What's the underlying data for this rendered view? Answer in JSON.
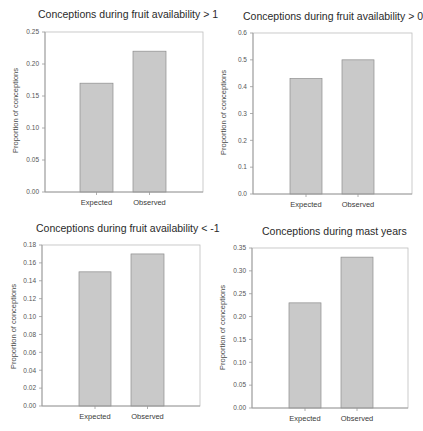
{
  "style": {
    "bar_fill": "#c9c9c9",
    "bar_stroke": "#8c8c8c",
    "axis_color": "#9a9a9a",
    "frame_color": "#bdbdbd"
  },
  "charts": [
    {
      "title": "Conceptions during fruit availability > 1",
      "ylabel": "Proportion of conceptions",
      "ticks": [
        "0.00",
        "0.05",
        "0.10",
        "0.15",
        "0.20",
        "0.25"
      ],
      "categories": [
        "Expected",
        "Observed"
      ]
    },
    {
      "title": "Conceptions during fruit availability > 0",
      "ylabel": "Proportion of conceptions",
      "ticks": [
        "0.0",
        "0.1",
        "0.2",
        "0.3",
        "0.4",
        "0.5",
        "0.6"
      ],
      "categories": [
        "Expected",
        "Observed"
      ]
    },
    {
      "title": "Conceptions during fruit availability < -1",
      "ylabel": "Proportion of conceptions",
      "ticks": [
        "0.00",
        "0.02",
        "0.04",
        "0.06",
        "0.08",
        "0.10",
        "0.12",
        "0.14",
        "0.16",
        "0.18"
      ],
      "categories": [
        "Expected",
        "Observed"
      ]
    },
    {
      "title": "Conceptions during mast years",
      "ylabel": "Proportion of conceptions",
      "ticks": [
        "0.00",
        "0.05",
        "0.10",
        "0.15",
        "0.20",
        "0.25",
        "0.30",
        "0.35"
      ],
      "categories": [
        "Expected",
        "Observed"
      ]
    }
  ],
  "chart_data": [
    {
      "type": "bar",
      "title": "Conceptions during fruit availability > 1",
      "xlabel": "",
      "ylabel": "Proportion of conceptions",
      "categories": [
        "Expected",
        "Observed"
      ],
      "values": [
        0.17,
        0.22
      ],
      "ylim": [
        0,
        0.25
      ],
      "yticks": [
        0.0,
        0.05,
        0.1,
        0.15,
        0.2,
        0.25
      ],
      "grid": false,
      "legend": null
    },
    {
      "type": "bar",
      "title": "Conceptions during fruit availability > 0",
      "xlabel": "",
      "ylabel": "Proportion of conceptions",
      "categories": [
        "Expected",
        "Observed"
      ],
      "values": [
        0.43,
        0.5
      ],
      "ylim": [
        0,
        0.6
      ],
      "yticks": [
        0.0,
        0.1,
        0.2,
        0.3,
        0.4,
        0.5,
        0.6
      ],
      "grid": false,
      "legend": null
    },
    {
      "type": "bar",
      "title": "Conceptions during fruit availability < -1",
      "xlabel": "",
      "ylabel": "Proportion of conceptions",
      "categories": [
        "Expected",
        "Observed"
      ],
      "values": [
        0.15,
        0.17
      ],
      "ylim": [
        0,
        0.18
      ],
      "yticks": [
        0.0,
        0.02,
        0.04,
        0.06,
        0.08,
        0.1,
        0.12,
        0.14,
        0.16,
        0.18
      ],
      "grid": false,
      "legend": null
    },
    {
      "type": "bar",
      "title": "Conceptions during mast years",
      "xlabel": "",
      "ylabel": "Proportion of conceptions",
      "categories": [
        "Expected",
        "Observed"
      ],
      "values": [
        0.23,
        0.33
      ],
      "ylim": [
        0,
        0.35
      ],
      "yticks": [
        0.0,
        0.05,
        0.1,
        0.15,
        0.2,
        0.25,
        0.3,
        0.35
      ],
      "grid": false,
      "legend": null
    }
  ]
}
